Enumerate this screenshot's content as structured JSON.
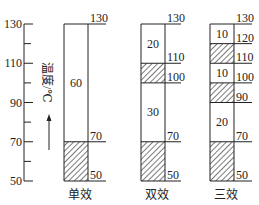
{
  "diagram": {
    "type": "temperature-distribution",
    "colors": {
      "line": "#222222",
      "hatch": "#333333",
      "background": "#ffffff"
    },
    "axis": {
      "label": "温度/℃",
      "ticks": [
        50,
        70,
        90,
        110,
        130
      ],
      "minor_ticks": [
        60,
        80,
        100,
        120
      ],
      "range": [
        50,
        130
      ],
      "arrow": "up"
    },
    "columns": [
      {
        "name": "单效",
        "boundaries": [
          50,
          70,
          130
        ],
        "segments": [
          {
            "from": 50,
            "to": 70,
            "type": "hatched",
            "label": ""
          },
          {
            "from": 70,
            "to": 130,
            "type": "blank",
            "label": "60"
          }
        ],
        "right_labels": [
          "130",
          "70",
          "50"
        ]
      },
      {
        "name": "双效",
        "boundaries": [
          50,
          70,
          100,
          110,
          130
        ],
        "segments": [
          {
            "from": 50,
            "to": 70,
            "type": "hatched",
            "label": ""
          },
          {
            "from": 70,
            "to": 100,
            "type": "blank",
            "label": "30"
          },
          {
            "from": 100,
            "to": 110,
            "type": "hatched",
            "label": ""
          },
          {
            "from": 110,
            "to": 130,
            "type": "blank",
            "label": "20"
          }
        ],
        "right_labels": [
          "130",
          "110",
          "100",
          "70",
          "50"
        ]
      },
      {
        "name": "三效",
        "boundaries": [
          50,
          70,
          90,
          100,
          110,
          120,
          130
        ],
        "segments": [
          {
            "from": 50,
            "to": 70,
            "type": "hatched",
            "label": ""
          },
          {
            "from": 70,
            "to": 90,
            "type": "blank",
            "label": "20"
          },
          {
            "from": 90,
            "to": 100,
            "type": "hatched",
            "label": ""
          },
          {
            "from": 100,
            "to": 110,
            "type": "blank",
            "label": "10"
          },
          {
            "from": 110,
            "to": 120,
            "type": "hatched",
            "label": ""
          },
          {
            "from": 120,
            "to": 130,
            "type": "blank",
            "label": "10"
          }
        ],
        "right_labels": [
          "130",
          "120",
          "110",
          "100",
          "90",
          "70",
          "50"
        ]
      }
    ]
  }
}
